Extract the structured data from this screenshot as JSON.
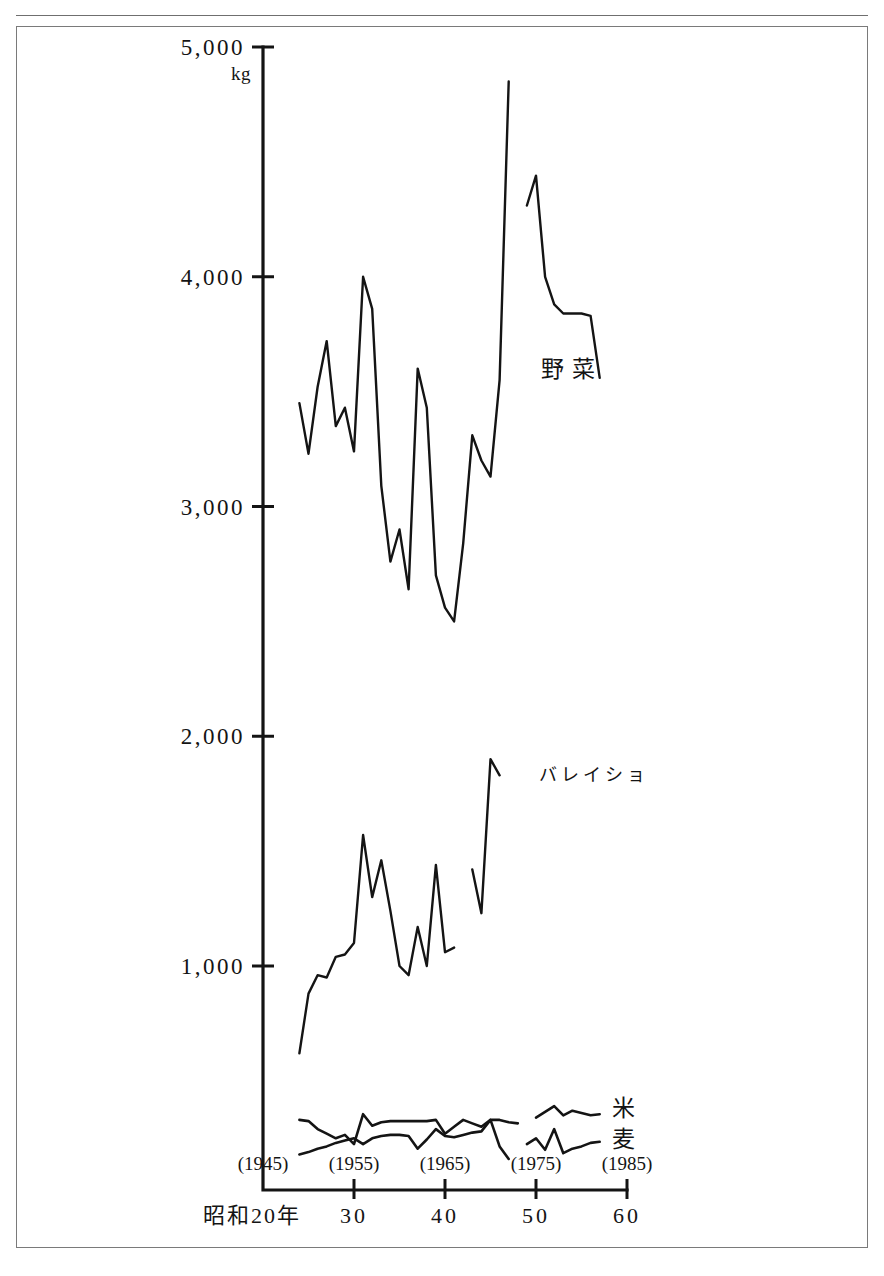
{
  "figure": {
    "title_cropped": "図  野菜等の１人当たり消費量",
    "frame_color": "#7a7a7a",
    "ink_color": "#141414"
  },
  "chart_data": {
    "type": "line",
    "title": "図  野菜等の１人当たり消費量",
    "xlabel": "昭和20年",
    "ylabel": "kg",
    "unit": "kg",
    "grid": false,
    "legend_position": "inline-right",
    "xlim": [
      20,
      60
    ],
    "ylim": [
      0,
      5000
    ],
    "yticks": [
      1000,
      2000,
      3000,
      4000,
      5000
    ],
    "ytick_labels": [
      "1,000",
      "2,000",
      "3,000",
      "4,000",
      "5,000"
    ],
    "xticks": [
      20,
      30,
      40,
      50,
      60
    ],
    "xtick_labels": [
      "昭和20年",
      "30",
      "40",
      "50",
      "60"
    ],
    "xtick_year_labels": [
      "(1945)",
      "(1955)",
      "(1965)",
      "(1975)",
      "(1985)"
    ],
    "xtick_years": [
      1945,
      1955,
      1965,
      1975,
      1985
    ],
    "series": [
      {
        "name": "野菜",
        "label": "野菜",
        "label_x": 50.5,
        "label_y": 3600,
        "x": [
          24,
          25,
          26,
          27,
          28,
          29,
          30,
          31,
          32,
          33,
          34,
          35,
          36,
          37,
          38,
          39,
          40,
          41,
          42,
          43,
          44,
          45,
          46,
          47,
          48,
          49,
          50,
          51,
          52,
          53,
          54,
          55,
          56,
          57
        ],
        "values": [
          3450,
          3230,
          3520,
          3720,
          3350,
          3430,
          3240,
          4000,
          3860,
          3090,
          2760,
          2900,
          2640,
          3600,
          3430,
          2700,
          2560,
          2500,
          2840,
          3310,
          3200,
          3130,
          3550,
          4850,
          null,
          4310,
          4440,
          4000,
          3880,
          3840,
          3840,
          3840,
          3830,
          3560
        ],
        "gaps": [
          [
            47,
            49
          ]
        ]
      },
      {
        "name": "バレイショ",
        "label": "バレイショ",
        "label_x": 50.3,
        "label_y": 1840,
        "x": [
          24,
          25,
          26,
          27,
          28,
          29,
          30,
          31,
          32,
          33,
          34,
          35,
          36,
          37,
          38,
          39,
          40,
          41,
          42,
          43,
          44,
          45,
          46
        ],
        "values": [
          620,
          880,
          960,
          950,
          1040,
          1050,
          1100,
          1570,
          1300,
          1460,
          1240,
          1000,
          960,
          1170,
          1000,
          1440,
          1060,
          1080,
          null,
          1420,
          1230,
          1900,
          1830
        ],
        "gaps": [
          [
            41,
            43
          ]
        ]
      },
      {
        "name": "米",
        "label": "米",
        "label_x": 58.3,
        "label_y": 380,
        "x": [
          24,
          25,
          26,
          27,
          28,
          29,
          30,
          31,
          32,
          33,
          34,
          35,
          36,
          37,
          38,
          39,
          40,
          41,
          42,
          43,
          44,
          45,
          46,
          47,
          48,
          49,
          50,
          51,
          52,
          53,
          54,
          55,
          56,
          57
        ],
        "values": [
          330,
          325,
          290,
          270,
          250,
          265,
          225,
          355,
          305,
          320,
          325,
          325,
          325,
          325,
          325,
          330,
          270,
          300,
          330,
          315,
          300,
          330,
          330,
          320,
          315,
          null,
          340,
          365,
          390,
          350,
          370,
          360,
          350,
          355
        ],
        "gaps": [
          [
            48,
            50
          ]
        ]
      },
      {
        "name": "麦",
        "label": "麦",
        "label_x": 58.3,
        "label_y": 245,
        "x": [
          24,
          25,
          26,
          27,
          28,
          29,
          30,
          31,
          32,
          33,
          34,
          35,
          36,
          37,
          38,
          39,
          40,
          41,
          42,
          43,
          44,
          45,
          46,
          47,
          48,
          49,
          50,
          51,
          52,
          53,
          54,
          55,
          56,
          57
        ],
        "values": [
          180,
          190,
          205,
          215,
          230,
          240,
          250,
          225,
          250,
          260,
          265,
          265,
          260,
          205,
          245,
          290,
          260,
          255,
          265,
          275,
          280,
          330,
          215,
          160,
          null,
          225,
          250,
          200,
          290,
          185,
          205,
          215,
          230,
          235
        ],
        "gaps": [
          [
            47,
            49
          ]
        ]
      }
    ]
  }
}
